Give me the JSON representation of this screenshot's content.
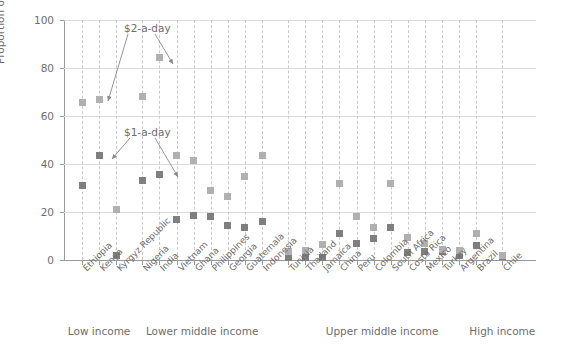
{
  "chart_data": {
    "type": "scatter",
    "title": "",
    "xlabel": "",
    "ylabel": "Proportion of total population (%)",
    "ylim": [
      0,
      100
    ],
    "yticks": [
      0,
      20,
      40,
      60,
      80,
      100
    ],
    "grid": "horizontal gridlines plus vertical dashed category lines",
    "legend": "none (inline annotations label the two series)",
    "annotations": [
      {
        "text": "$2-a-day",
        "points_to": [
          "Kenya $2-a-day",
          "Nigeria $2-a-day"
        ]
      },
      {
        "text": "$1-a-day",
        "points_to": [
          "Kenya $1-a-day",
          "Nigeria $1-a-day"
        ]
      }
    ],
    "categories": [
      "Ethiopia",
      "Kenya",
      "Kyrgyz Republic",
      "Nigeria",
      "India",
      "Vietnam",
      "Ghana",
      "Philippines",
      "Georgia",
      "Guatemala",
      "Indonesia",
      "Tunisia",
      "Thailand",
      "Jamaica",
      "China",
      "Peru",
      "Colombia",
      "South Africa",
      "Costa Rica",
      "Mexico",
      "Turkey",
      "Argentina",
      "Brazil",
      "Chile"
    ],
    "groups": [
      {
        "label": "Low income",
        "categories": [
          "Ethiopia",
          "Kenya",
          "Kyrgyz Republic"
        ]
      },
      {
        "label": "Lower middle income",
        "categories": [
          "Nigeria",
          "India",
          "Vietnam",
          "Ghana",
          "Philippines",
          "Georgia",
          "Guatemala",
          "Indonesia"
        ]
      },
      {
        "label": "Upper middle income",
        "categories": [
          "Tunisia",
          "Thailand",
          "Jamaica",
          "China",
          "Peru",
          "Colombia",
          "South Africa",
          "Costa Rica",
          "Mexico",
          "Turkey",
          "Argentina",
          "Brazil"
        ]
      },
      {
        "label": "High income",
        "categories": [
          "Chile"
        ]
      }
    ],
    "series": [
      {
        "name": "$1-a-day",
        "color": "#7f7f7f",
        "values": [
          31,
          43.5,
          2,
          33,
          35.5,
          17,
          18.5,
          18,
          14.5,
          13.5,
          16,
          1,
          1,
          1,
          11,
          7,
          9,
          13.5,
          3,
          3.5,
          3.5,
          2,
          6,
          1.5
        ]
      },
      {
        "name": "$2-a-day",
        "color": "#b0b0b0",
        "values": [
          65.5,
          67,
          21,
          68,
          84.5,
          43.5,
          41.5,
          29,
          26.5,
          35,
          43.5,
          3.5,
          4,
          6.5,
          32,
          18,
          13.5,
          32,
          9.5,
          7,
          4.5,
          4,
          11,
          2
        ]
      }
    ]
  }
}
